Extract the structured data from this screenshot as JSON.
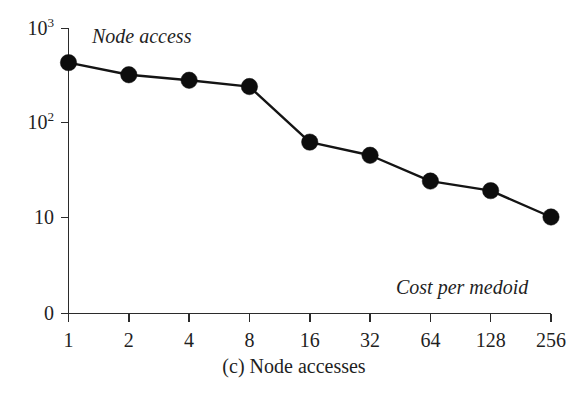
{
  "chart_data": {
    "type": "line",
    "title": "",
    "caption": "(c) Node accesses",
    "xlabel": "Cost per medoid",
    "ylabel": "Node access",
    "x_categories": [
      "1",
      "2",
      "4",
      "8",
      "16",
      "32",
      "64",
      "128",
      "256"
    ],
    "x": [
      1,
      2,
      4,
      8,
      16,
      32,
      64,
      128,
      256
    ],
    "values": [
      430,
      320,
      280,
      240,
      62,
      45,
      24,
      19,
      10
    ],
    "series": [
      {
        "name": "Node access",
        "values": [
          430,
          320,
          280,
          240,
          62,
          45,
          24,
          19,
          10
        ]
      }
    ],
    "yscale": "log",
    "y_tick_labels": [
      "10³",
      "10²",
      "10",
      "0"
    ],
    "y_tick_values": [
      1000,
      100,
      10,
      0
    ],
    "ylim": [
      0,
      1000
    ],
    "grid": false,
    "legend": "none",
    "marker": "filled-circle",
    "line_color": "#141414",
    "marker_color": "#0d0d0d",
    "background": "#ffffff"
  },
  "axes": {
    "y_ticks": [
      {
        "label_main": "10",
        "label_exp": "3"
      },
      {
        "label_main": "10",
        "label_exp": "2"
      },
      {
        "label_main": "10",
        "label_exp": ""
      },
      {
        "label_main": "0",
        "label_exp": ""
      }
    ],
    "x_ticks": [
      "1",
      "2",
      "4",
      "8",
      "16",
      "32",
      "64",
      "128",
      "256"
    ]
  },
  "annotations": {
    "top_left": "Node access",
    "bottom_right": "Cost per medoid"
  },
  "caption": "(c) Node accesses"
}
